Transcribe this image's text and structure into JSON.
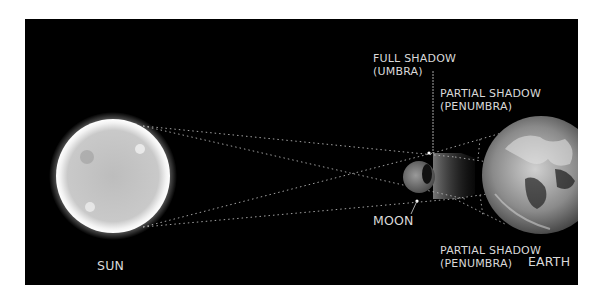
{
  "diagram": {
    "type": "solar-eclipse-shadow-diagram",
    "background_color": "#000000",
    "page_color": "#ffffff",
    "bodies": {
      "sun": {
        "label": "SUN"
      },
      "moon": {
        "label": "MOON"
      },
      "earth": {
        "label": "EARTH"
      }
    },
    "labels": {
      "umbra": {
        "line1": "FULL SHADOW",
        "line2": "(UMBRA)"
      },
      "penumbra_top": {
        "line1": "PARTIAL SHADOW",
        "line2": "(PENUMBRA)"
      },
      "penumbra_bottom": {
        "line1": "PARTIAL SHADOW",
        "line2": "(PENUMBRA)"
      }
    },
    "colors": {
      "text": "#d9d9d9",
      "dotted_rays": "#bfbfbf",
      "sun_fill": "#c8c8c8",
      "sun_glow": "#ffffff",
      "moon_fill": "#7a7a7a",
      "earth_fill": "#9a9a9a"
    }
  }
}
